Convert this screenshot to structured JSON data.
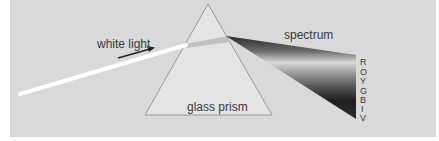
{
  "diagram": {
    "labels": {
      "incoming_light": "white light",
      "prism": "glass prism",
      "output": "spectrum"
    },
    "spectrum_colors": [
      "R",
      "O",
      "Y",
      "G",
      "B",
      "I",
      "V"
    ],
    "colors": {
      "background": "#d9d9d9",
      "prism_fill": "#e4e4e4",
      "prism_stroke": "#9a9a9a",
      "beam": "#ffffff",
      "text": "#3a3a3a"
    }
  }
}
